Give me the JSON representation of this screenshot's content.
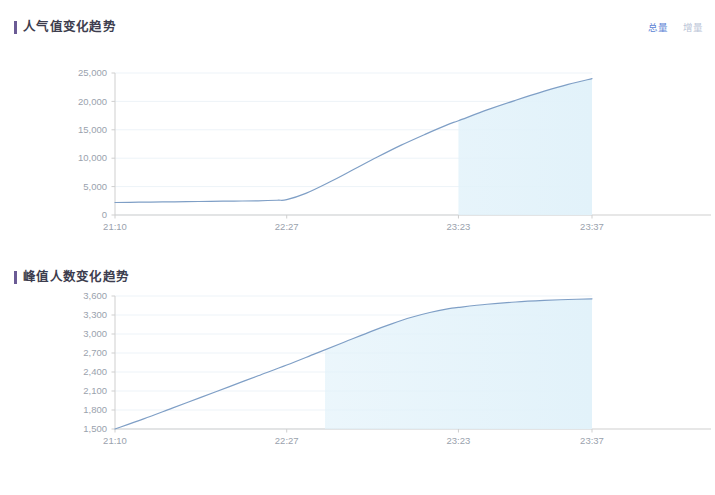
{
  "theme": {
    "line_color": "#7f9fc6",
    "area_fill_color": "#e2f2fa",
    "grid_color": "#edf3f8",
    "axis_color": "#cfcfcf",
    "tick_label_color": "#9aa2ad",
    "accent_bar_color": "#6b5b95",
    "legend_active_color": "#5b7fd4",
    "legend_inactive_color": "#b9c3d6",
    "title_color": "#3d3d4e",
    "background": "#ffffff"
  },
  "panels": [
    {
      "id": "popularity-trend",
      "title": "人气值变化趋势",
      "legend": [
        {
          "label": "总量",
          "state": "active"
        },
        {
          "label": "增量",
          "state": "inactive"
        }
      ]
    },
    {
      "id": "peak-audience-trend",
      "title": "峰值人数变化趋势",
      "legend": []
    }
  ],
  "chart_data": [
    {
      "type": "area",
      "title": "人气值变化趋势",
      "xlabel": "",
      "ylabel": "",
      "grid": true,
      "legend": [
        "总量",
        "增量"
      ],
      "legend_position": "top-right",
      "ylim": [
        0,
        25000
      ],
      "yticks": [
        0,
        5000,
        10000,
        15000,
        20000,
        25000
      ],
      "ytick_labels": [
        "0",
        "5,000",
        "10,000",
        "15,000",
        "20,000",
        "25,000"
      ],
      "xticks": [
        "21:10",
        "22:27",
        "23:23",
        "23:37"
      ],
      "xtick_positions": [
        0.0,
        0.36,
        0.72,
        1.0
      ],
      "series": [
        {
          "name": "总量",
          "x": [
            0.0,
            0.05,
            0.1,
            0.15,
            0.2,
            0.25,
            0.3,
            0.34,
            0.36,
            0.4,
            0.45,
            0.5,
            0.55,
            0.6,
            0.65,
            0.7,
            0.72,
            0.78,
            0.84,
            0.9,
            0.95,
            1.0
          ],
          "values": [
            2200,
            2250,
            2300,
            2350,
            2400,
            2450,
            2500,
            2600,
            2700,
            3800,
            5800,
            8000,
            10200,
            12300,
            14200,
            16000,
            16600,
            18500,
            20200,
            21800,
            23000,
            24000
          ]
        }
      ],
      "fill_start_fraction": 0.72
    },
    {
      "type": "area",
      "title": "峰值人数变化趋势",
      "xlabel": "",
      "ylabel": "",
      "grid": true,
      "legend": [],
      "ylim": [
        1500,
        3600
      ],
      "yticks": [
        1500,
        1800,
        2100,
        2400,
        2700,
        3000,
        3300,
        3600
      ],
      "ytick_labels": [
        "1,500",
        "1,800",
        "2,100",
        "2,400",
        "2,700",
        "3,000",
        "3,300",
        "3,600"
      ],
      "xticks": [
        "21:10",
        "22:27",
        "23:23",
        "23:37"
      ],
      "xtick_positions": [
        0.0,
        0.36,
        0.72,
        1.0
      ],
      "series": [
        {
          "name": "峰值人数",
          "x": [
            0.0,
            0.06,
            0.12,
            0.18,
            0.24,
            0.3,
            0.36,
            0.42,
            0.48,
            0.54,
            0.58,
            0.62,
            0.66,
            0.7,
            0.72,
            0.78,
            0.84,
            0.9,
            0.95,
            1.0
          ],
          "values": [
            1500,
            1660,
            1830,
            2000,
            2170,
            2340,
            2510,
            2690,
            2870,
            3050,
            3160,
            3260,
            3340,
            3400,
            3420,
            3470,
            3505,
            3530,
            3545,
            3555
          ]
        }
      ],
      "fill_start_fraction": 0.44
    }
  ]
}
